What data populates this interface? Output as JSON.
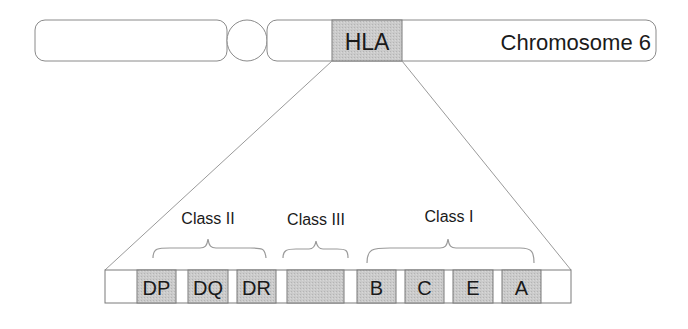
{
  "chromosome": {
    "label": "Chromosome 6",
    "region_label": "HLA"
  },
  "classes": [
    {
      "name": "Class II",
      "genes": [
        "DP",
        "DQ",
        "DR"
      ]
    },
    {
      "name": "Class III",
      "genes": [
        ""
      ]
    },
    {
      "name": "Class I",
      "genes": [
        "B",
        "C",
        "E",
        "A"
      ]
    }
  ],
  "genes": {
    "dp": "DP",
    "dq": "DQ",
    "dr": "DR",
    "b": "B",
    "c": "C",
    "e": "E",
    "a": "A"
  },
  "class_labels": {
    "class2": "Class II",
    "class3": "Class III",
    "class1": "Class I"
  },
  "colors": {
    "gene_fill": "#c8c8c8",
    "outline": "#7a7a7a",
    "text": "#1a1a1a",
    "background": "#ffffff"
  }
}
